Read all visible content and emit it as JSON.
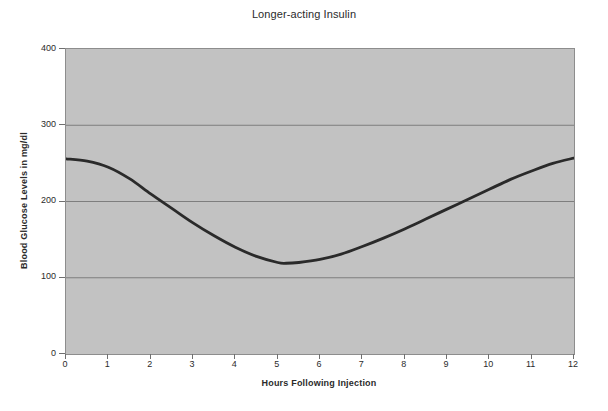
{
  "chart_data": {
    "type": "line",
    "title": "Longer-acting Insulin",
    "xlabel": "Hours Following Injection",
    "ylabel": "Blood Glucose Levels in mg/dl",
    "xlim": [
      0,
      12
    ],
    "ylim": [
      0,
      400
    ],
    "grid": true,
    "legend": "none",
    "background_color": "#c2c2c2",
    "line_color": "#2a2a2a",
    "gridline_color": "#7e7e7e",
    "xticks": [
      "0",
      "1",
      "2",
      "3",
      "4",
      "5",
      "6",
      "7",
      "8",
      "9",
      "10",
      "11",
      "12"
    ],
    "yticks": [
      "0",
      "100",
      "200",
      "300",
      "400"
    ],
    "gridline_values": [
      100,
      200,
      300
    ],
    "series": [
      {
        "name": "Blood glucose",
        "x": [
          0,
          0.5,
          1,
          1.5,
          2,
          2.5,
          3,
          3.5,
          4,
          4.5,
          5,
          5.2,
          5.5,
          6,
          6.5,
          7,
          7.5,
          8,
          8.5,
          9,
          9.5,
          10,
          10.5,
          11,
          11.5,
          12
        ],
        "values": [
          256,
          253,
          245,
          230,
          210,
          191,
          172,
          155,
          140,
          128,
          120,
          119,
          120,
          124,
          131,
          141,
          152,
          164,
          177,
          190,
          203,
          216,
          229,
          240,
          250,
          257
        ]
      }
    ],
    "annotations": {
      "minimum_value": 119,
      "minimum_hour": 5.2,
      "start_value": 256,
      "end_value": 257
    }
  }
}
